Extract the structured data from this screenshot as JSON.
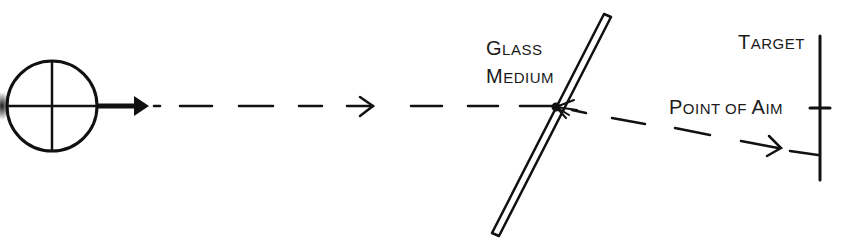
{
  "diagram": {
    "labels": {
      "glass": {
        "line1_cap": "G",
        "line1_rest": "LASS",
        "line2_cap": "M",
        "line2_rest": "EDIUM"
      },
      "target": {
        "cap": "T",
        "rest": "ARGET"
      },
      "aim": {
        "cap1": "P",
        "rest1": "OINT OF ",
        "cap2": "A",
        "rest2": "IM"
      }
    },
    "elements": [
      "scope-reticle-icon",
      "bullet-arrow",
      "incoming-dashed-trajectory",
      "glass-medium-pane",
      "deflected-dashed-trajectory",
      "target-line",
      "point-of-aim-tick"
    ],
    "colors": {
      "ink": "#111111",
      "background": "#ffffff"
    }
  }
}
